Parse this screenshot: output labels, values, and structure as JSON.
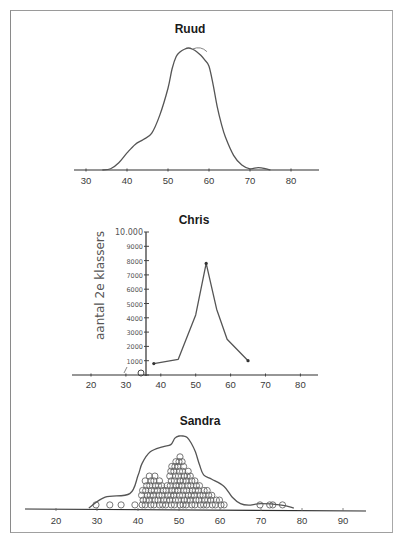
{
  "chart_data": [
    {
      "type": "line",
      "title": "Ruud",
      "style": "smooth density curve (hand-drawn)",
      "xlabel": "",
      "ylabel": "",
      "xlim": [
        27,
        88
      ],
      "xticks": [
        30,
        40,
        50,
        60,
        70,
        80
      ],
      "tick_labels": [
        "30",
        "40",
        "50",
        "60",
        "70",
        "80"
      ],
      "series": [
        {
          "name": "Ruud",
          "x": [
            34,
            36,
            38,
            40,
            42,
            44,
            46,
            48,
            50,
            51,
            52,
            53,
            54,
            55,
            56,
            57,
            58,
            59,
            60,
            61,
            62,
            63,
            64,
            66,
            68,
            70,
            72,
            74,
            75
          ],
          "y": [
            0,
            0.01,
            0.06,
            0.14,
            0.21,
            0.25,
            0.3,
            0.45,
            0.67,
            0.83,
            0.93,
            0.97,
            0.99,
            1.0,
            0.99,
            0.97,
            0.94,
            0.9,
            0.85,
            0.7,
            0.52,
            0.38,
            0.27,
            0.12,
            0.04,
            0.01,
            0.02,
            0.01,
            0
          ]
        }
      ]
    },
    {
      "type": "line",
      "title": "Chris",
      "style": "hand-drawn line with handwritten y-axis",
      "xlabel": "",
      "ylabel": "aantal 2e klassers",
      "xlim": [
        16,
        84
      ],
      "ylim": [
        0,
        10000
      ],
      "xticks": [
        20,
        30,
        40,
        50,
        60,
        70,
        80
      ],
      "tick_labels": [
        "20",
        "30",
        "40",
        "50",
        "60",
        "70",
        "80"
      ],
      "yticks": [
        0,
        1000,
        2000,
        3000,
        4000,
        5000,
        6000,
        7000,
        8000,
        9000,
        10000
      ],
      "ytick_labels": [
        "0",
        "1000",
        "2000",
        "3000",
        "4000",
        "5000",
        "6000",
        "7000",
        "8000",
        "9000",
        "10.000"
      ],
      "series": [
        {
          "name": "Chris",
          "x": [
            38,
            45,
            50,
            53,
            56,
            59,
            65
          ],
          "y": [
            800,
            1100,
            4200,
            7800,
            4600,
            2500,
            1000
          ]
        }
      ]
    },
    {
      "type": "scatter",
      "title": "Sandra",
      "style": "stacked hand-drawn circles (dot plot) with outline contour",
      "xlabel": "",
      "ylabel": "",
      "xlim": [
        13,
        95
      ],
      "xticks": [
        20,
        30,
        40,
        50,
        60,
        70,
        80,
        90
      ],
      "tick_labels": [
        "20",
        "30",
        "40",
        "50",
        "60",
        "70",
        "80",
        "90"
      ],
      "column_counts": {
        "x": [
          30,
          33,
          36,
          39,
          41,
          42,
          43,
          44,
          45,
          46,
          47,
          48,
          49,
          50,
          51,
          52,
          53,
          54,
          55,
          56,
          57,
          58,
          59,
          60,
          61,
          70,
          72,
          73,
          75
        ],
        "count": [
          1,
          1,
          1,
          1,
          4,
          6,
          7,
          7,
          6,
          5,
          5,
          9,
          10,
          11,
          10,
          8,
          7,
          6,
          5,
          4,
          4,
          3,
          2,
          2,
          1,
          1,
          1,
          1,
          1
        ]
      },
      "outline": {
        "x": [
          28,
          32,
          38,
          40,
          41,
          43,
          46,
          48,
          49,
          50,
          51,
          52,
          53,
          54,
          55,
          56,
          58,
          61,
          63,
          65,
          67,
          70,
          75,
          78
        ],
        "y": [
          0,
          0.15,
          0.2,
          0.45,
          0.62,
          0.78,
          0.85,
          0.88,
          0.97,
          1.0,
          1.0,
          0.98,
          0.9,
          0.78,
          0.6,
          0.46,
          0.4,
          0.3,
          0.15,
          0.06,
          0.04,
          0.06,
          0.04,
          0.0
        ]
      }
    }
  ]
}
